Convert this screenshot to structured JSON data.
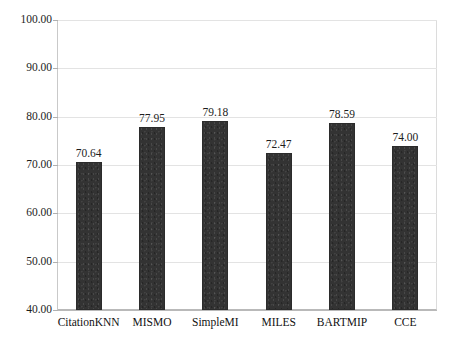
{
  "figure": {
    "top_cut_text": "",
    "background_color": "#ffffff",
    "bar_color": "#333333",
    "gridline_color": "#e3e3e3",
    "axis_color": "#b9b9b9"
  },
  "chart_data": {
    "type": "bar",
    "title": "",
    "xlabel": "",
    "ylabel": "",
    "categories": [
      "CitationKNN",
      "MISMO",
      "SimpleMI",
      "MILES",
      "BARTMIP",
      "CCE"
    ],
    "values": [
      70.64,
      77.95,
      79.18,
      72.47,
      78.59,
      74.0
    ],
    "value_labels": [
      "70.64",
      "77.95",
      "79.18",
      "72.47",
      "78.59",
      "74.00"
    ],
    "ylim": [
      40.0,
      100.0
    ],
    "ytick_values": [
      100.0,
      90.0,
      80.0,
      70.0,
      60.0,
      50.0,
      40.0
    ],
    "ytick_labels": [
      "100.00",
      "90.00",
      "80.00",
      "70.00",
      "60.00",
      "50.00",
      "40.00"
    ],
    "ytick_step": 10.0,
    "grid": true,
    "grid_axis": "y",
    "legend": false,
    "legend_position": "none",
    "series": [
      {
        "name": "accuracy",
        "values": [
          70.64,
          77.95,
          79.18,
          72.47,
          78.59,
          74.0
        ]
      }
    ]
  }
}
